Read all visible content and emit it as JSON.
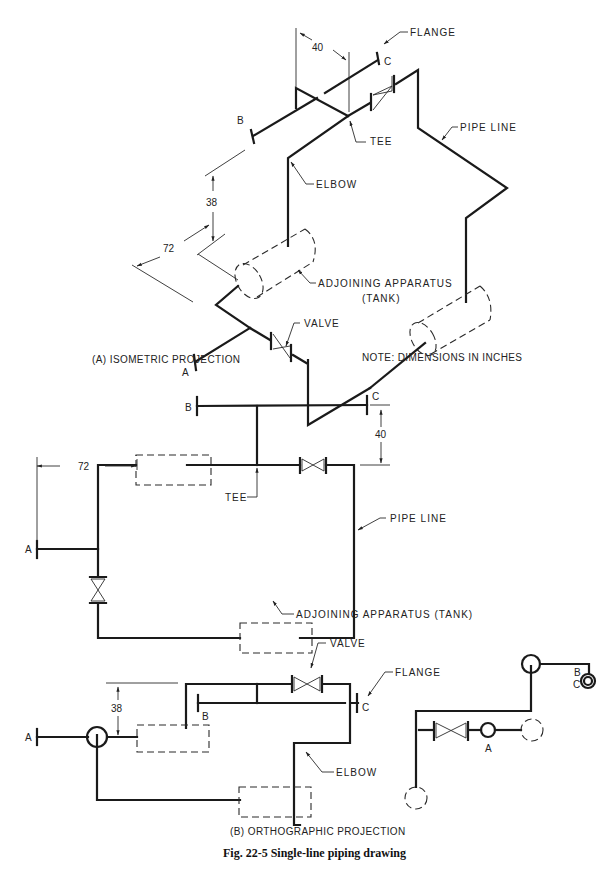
{
  "figure": {
    "caption": "Fig. 22-5  Single-line piping drawing"
  },
  "isometric": {
    "caption": "(A)  ISOMETRIC PROJECTION",
    "note": "NOTE:  DIMENSIONS IN INCHES",
    "labels": {
      "flange": "FLANGE",
      "tee": "TEE",
      "pipe_line": "PIPE LINE",
      "elbow": "ELBOW",
      "apparatus_line1": "ADJOINING APPARATUS",
      "apparatus_line2": "(TANK)",
      "valve": "VALVE"
    },
    "points": {
      "a": "A",
      "b": "B",
      "c": "C"
    },
    "dimensions": {
      "d40": "40",
      "d38": "38",
      "d72": "72"
    }
  },
  "orthographic_top": {
    "labels": {
      "tee": "TEE",
      "pipe_line": "PIPE LINE",
      "apparatus": "ADJOINING APPARATUS (TANK)"
    },
    "points": {
      "a": "A",
      "b": "B",
      "c": "C"
    },
    "dimensions": {
      "d72": "72",
      "d40": "40"
    }
  },
  "orthographic_front": {
    "caption": "(B)  ORTHOGRAPHIC PROJECTION",
    "labels": {
      "valve": "VALVE",
      "flange": "FLANGE",
      "elbow": "ELBOW"
    },
    "points": {
      "a": "A",
      "b": "B",
      "c": "C"
    },
    "dimensions": {
      "d38": "38"
    }
  },
  "orthographic_side": {
    "points": {
      "a": "A",
      "b": "B",
      "c": "C"
    }
  }
}
